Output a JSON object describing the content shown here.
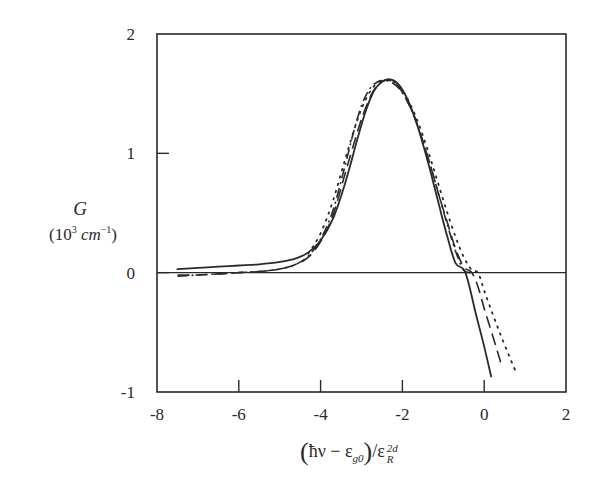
{
  "chart_data": {
    "type": "line",
    "title": "",
    "ylabel": "G",
    "ylabel_units": "(10^3 cm^-1)",
    "xlabel": "(ħν − ε_g0)/ε_R^2d",
    "xlim": [
      -8,
      2
    ],
    "ylim": [
      -1,
      2
    ],
    "xticks": [
      -8,
      -6,
      -4,
      -2,
      0,
      2
    ],
    "yticks": [
      -1,
      0,
      1,
      2
    ],
    "xtick_labels": [
      "-8",
      "-6",
      "-4",
      "-2",
      "0",
      "2"
    ],
    "ytick_labels": [
      "-1",
      "0",
      "1",
      "2"
    ],
    "grid": false,
    "legend": null,
    "reference_line": {
      "y": 0,
      "style": "solid"
    },
    "series": [
      {
        "name": "solid",
        "style": "solid",
        "x": [
          -7.5,
          -7.0,
          -6.5,
          -6.0,
          -5.5,
          -5.0,
          -4.6,
          -4.3,
          -4.0,
          -3.7,
          -3.4,
          -3.1,
          -2.9,
          -2.7,
          -2.5,
          -2.3,
          -2.1,
          -1.9,
          -1.7,
          -1.5,
          -1.3,
          -1.1,
          -0.9,
          -0.7,
          -0.46,
          -0.2,
          0.0,
          0.17
        ],
        "y": [
          0.03,
          0.04,
          0.05,
          0.06,
          0.07,
          0.09,
          0.12,
          0.17,
          0.27,
          0.45,
          0.75,
          1.12,
          1.35,
          1.52,
          1.6,
          1.62,
          1.58,
          1.47,
          1.3,
          1.08,
          0.83,
          0.56,
          0.3,
          0.08,
          0.0,
          -0.35,
          -0.62,
          -0.87
        ]
      },
      {
        "name": "dash-dot",
        "style": "dashdot",
        "x": [
          -7.5,
          -7.0,
          -6.5,
          -6.0,
          -5.5,
          -5.0,
          -4.6,
          -4.3,
          -4.0,
          -3.7,
          -3.4,
          -3.2,
          -3.0,
          -2.8,
          -2.6,
          -2.45,
          -2.3,
          -2.1,
          -1.9,
          -1.7,
          -1.5,
          -1.3,
          -1.1,
          -0.9,
          -0.7,
          -0.5,
          -0.3
        ],
        "y": [
          -0.03,
          -0.02,
          -0.01,
          0.0,
          0.01,
          0.03,
          0.07,
          0.14,
          0.28,
          0.52,
          0.9,
          1.17,
          1.4,
          1.54,
          1.6,
          1.61,
          1.6,
          1.55,
          1.45,
          1.3,
          1.1,
          0.88,
          0.64,
          0.4,
          0.18,
          0.02,
          0.0
        ]
      },
      {
        "name": "dashed",
        "style": "dashed",
        "x": [
          -7.5,
          -7.0,
          -6.5,
          -6.0,
          -5.5,
          -5.0,
          -4.6,
          -4.3,
          -4.0,
          -3.7,
          -3.4,
          -3.1,
          -2.9,
          -2.7,
          -2.5,
          -2.3,
          -2.1,
          -1.9,
          -1.7,
          -1.5,
          -1.3,
          -1.1,
          -0.9,
          -0.7,
          -0.5,
          -0.3,
          -0.15,
          0.0,
          0.2,
          0.41
        ],
        "y": [
          -0.02,
          -0.02,
          -0.01,
          0.0,
          0.01,
          0.03,
          0.07,
          0.13,
          0.26,
          0.48,
          0.83,
          1.18,
          1.38,
          1.53,
          1.6,
          1.61,
          1.56,
          1.45,
          1.3,
          1.1,
          0.88,
          0.64,
          0.42,
          0.2,
          0.05,
          0.0,
          -0.12,
          -0.3,
          -0.52,
          -0.76
        ]
      },
      {
        "name": "dotted",
        "style": "dotted",
        "x": [
          -4.3,
          -4.0,
          -3.7,
          -3.4,
          -3.1,
          -2.9,
          -2.7,
          -2.5,
          -2.3,
          -2.1,
          -1.9,
          -1.7,
          -1.5,
          -1.3,
          -1.1,
          -0.9,
          -0.7,
          -0.5,
          -0.3,
          -0.15,
          0.0,
          0.2,
          0.4,
          0.6,
          0.76
        ],
        "y": [
          0.16,
          0.33,
          0.6,
          0.95,
          1.28,
          1.45,
          1.56,
          1.61,
          1.61,
          1.57,
          1.47,
          1.33,
          1.15,
          0.94,
          0.72,
          0.5,
          0.3,
          0.13,
          0.02,
          0.0,
          -0.15,
          -0.34,
          -0.52,
          -0.69,
          -0.82
        ]
      }
    ]
  },
  "labels": {
    "ylabel_symbol": "G",
    "ylabel_units_prefix": "(10",
    "ylabel_units_exp": "3",
    "ylabel_units_unit": "cm",
    "ylabel_units_exp2": "−1",
    "ylabel_units_suffix": ")",
    "xlabel_open": "(",
    "xlabel_hnu": "ħν − ε",
    "xlabel_sub": "g0",
    "xlabel_close": ")",
    "xlabel_slash": "/ε",
    "xlabel_sup": "2d",
    "xlabel_sub2": "R"
  },
  "colors": {
    "ink": "#2a2a2a",
    "background": "#ffffff"
  }
}
